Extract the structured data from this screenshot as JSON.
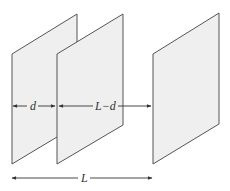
{
  "figure": {
    "planes": [
      "plane-1",
      "plane-2",
      "plane-3"
    ],
    "dimensions": {
      "d_label": "d",
      "L_minus_d_label": "L−d",
      "L_label": "L"
    }
  }
}
